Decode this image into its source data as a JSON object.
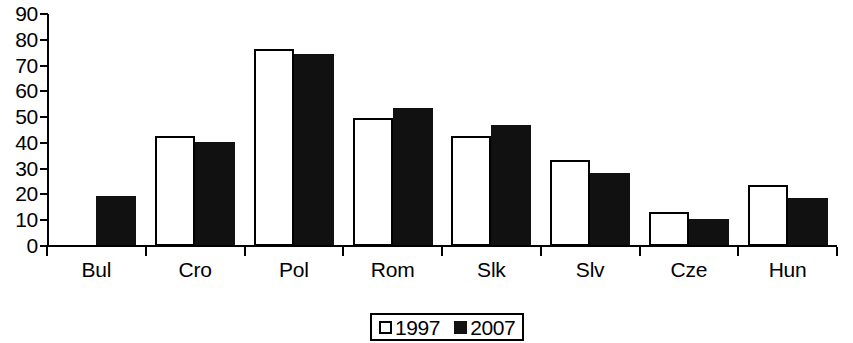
{
  "chart_data": {
    "type": "bar",
    "title": "",
    "subtitle": "",
    "xlabel": "",
    "ylabel": "",
    "categories": [
      "Bul",
      "Cro",
      "Pol",
      "Rom",
      "Slk",
      "Slv",
      "Cze",
      "Hun"
    ],
    "series": [
      {
        "name": "1997",
        "color": "#ffffff",
        "values": [
          null,
          42.5,
          76.5,
          49.5,
          42.5,
          33.5,
          13.0,
          23.5
        ]
      },
      {
        "name": "2007",
        "color": "#111111",
        "values": [
          19.5,
          40.5,
          74.5,
          53.5,
          47.0,
          28.5,
          10.5,
          18.5
        ]
      }
    ],
    "ylim": [
      0,
      90
    ],
    "ytick_values": [
      "0",
      "10",
      "20",
      "30",
      "40",
      "50",
      "60",
      "70",
      "80",
      "90"
    ],
    "ytick_step": 10,
    "grid": false,
    "legend_position": "bottom-center",
    "legend_entries": [
      {
        "label": "1997",
        "swatch": "open-square"
      },
      {
        "label": "2007",
        "swatch": "filled-square"
      }
    ],
    "axis_color": "#000000",
    "background": "#ffffff"
  }
}
